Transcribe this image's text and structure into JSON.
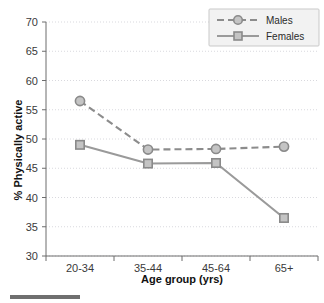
{
  "chart_data": {
    "type": "line",
    "title": "",
    "xlabel": "Age group (yrs)",
    "ylabel": "% Physically active",
    "categories": [
      "20-34",
      "35-44",
      "45-64",
      "65+"
    ],
    "ylim": [
      30,
      70
    ],
    "yticks": [
      30,
      35,
      40,
      45,
      50,
      55,
      60,
      65,
      70
    ],
    "ytick_labels": [
      "30",
      "35",
      "40",
      "45",
      "50",
      "55",
      "60",
      "65",
      "70"
    ],
    "grid": true,
    "legend_position": "top-right",
    "series": [
      {
        "name": "Males",
        "values": [
          56.5,
          48.2,
          48.3,
          48.7
        ],
        "line_style": "dashed",
        "marker": "circle",
        "color": "#8c8c8c"
      },
      {
        "name": "Females",
        "values": [
          49.0,
          45.8,
          45.9,
          36.5
        ],
        "line_style": "solid",
        "marker": "square",
        "color": "#9a9a9a"
      }
    ]
  },
  "legend": {
    "entries": [
      {
        "label": "Males"
      },
      {
        "label": "Females"
      }
    ]
  },
  "colors": {
    "males_line": "#8c8c8c",
    "females_line": "#9a9a9a",
    "marker_fill": "#c4c4c4",
    "marker_stroke": "#8a8a8a",
    "axis": "#6d6d6d",
    "grid": "#d9d9de",
    "text": "#2b2b2b",
    "caption_rule": "#6f6f6f"
  },
  "caption_rule": {
    "present": true
  }
}
